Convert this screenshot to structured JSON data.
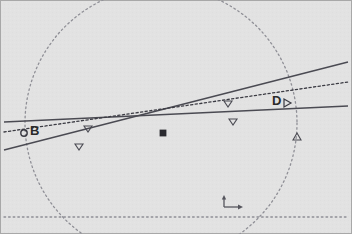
{
  "figure": {
    "width": 352,
    "height": 234,
    "background_color": "#e2e2e2",
    "border_color": "#9a9a9a"
  },
  "chart_data": {
    "type": "scatter",
    "title": "",
    "xlabel": "",
    "ylabel": "",
    "xlim": [
      0,
      352
    ],
    "ylim": [
      0,
      234
    ],
    "grid": false,
    "legend": "none",
    "coordinate_system": "screen pixels, origin top-left",
    "circle": {
      "name": "dashed-circle",
      "center_x": 161,
      "center_y": 123,
      "radius": 136,
      "style": "dotted",
      "color": "#8f8f96"
    },
    "horizontal_axis_line": {
      "name": "baseline",
      "y": 217,
      "x_start": 4,
      "x_end": 348,
      "style": "dotted",
      "color": "#8f8f96"
    },
    "lines": [
      {
        "name": "line-1-upper-solid",
        "style": "solid",
        "color": "#4a4a52",
        "x1": 4,
        "y1": 150,
        "x2": 348,
        "y2": 62
      },
      {
        "name": "line-2-lower-solid",
        "style": "solid",
        "color": "#4a4a52",
        "x1": 4,
        "y1": 122,
        "x2": 348,
        "y2": 106
      },
      {
        "name": "line-3-dotted",
        "style": "dotted",
        "color": "#3c3c44",
        "x1": 4,
        "y1": 132,
        "x2": 348,
        "y2": 82
      }
    ],
    "points": [
      {
        "name": "point-B",
        "label": "B",
        "x": 24,
        "y": 133,
        "marker": "circle",
        "label_dx": 6,
        "label_dy": -7
      },
      {
        "name": "point-D",
        "label": "D",
        "x": 284,
        "y": 103,
        "marker": "triangle-right",
        "label_dx": -10,
        "label_dy": -7
      },
      {
        "name": "intersection-point",
        "label": "",
        "x": 163,
        "y": 133,
        "marker": "filled-square",
        "label_dx": 0,
        "label_dy": 0
      }
    ],
    "markers": [
      {
        "name": "marker-down-1",
        "x": 88,
        "y": 129,
        "shape": "triangle-down"
      },
      {
        "name": "marker-down-2",
        "x": 79,
        "y": 147,
        "shape": "triangle-down"
      },
      {
        "name": "marker-down-3",
        "x": 228,
        "y": 104,
        "shape": "triangle-down"
      },
      {
        "name": "marker-down-4",
        "x": 233,
        "y": 122,
        "shape": "triangle-down"
      },
      {
        "name": "marker-up-1",
        "x": 297,
        "y": 137,
        "shape": "triangle-up"
      }
    ],
    "axis_indicator": {
      "name": "axis-origin-indicator",
      "x": 224,
      "y": 198,
      "x_arrow_length": 16,
      "y_arrow_length": 10,
      "color": "#5a5a62"
    }
  },
  "labels": {
    "B": "B",
    "D": "D"
  }
}
